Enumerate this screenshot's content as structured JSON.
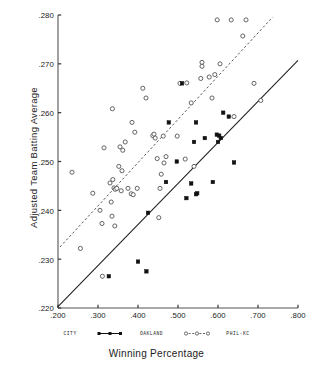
{
  "chart_data": {
    "type": "scatter",
    "title": "",
    "xlabel": "Winning Percentage",
    "ylabel": "Adjusted Team Batting Average",
    "xlim": [
      0.2,
      0.8
    ],
    "ylim": [
      0.22,
      0.28
    ],
    "xticks": [
      ".200",
      ".300",
      ".400",
      ".500",
      ".600",
      ".700",
      ".800"
    ],
    "xtick_values": [
      0.2,
      0.3,
      0.4,
      0.5,
      0.6,
      0.7,
      0.8
    ],
    "yticks": [
      ".280",
      ".270",
      ".260",
      ".250",
      ".240",
      ".230",
      ".220"
    ],
    "ytick_values": [
      0.28,
      0.27,
      0.26,
      0.25,
      0.24,
      0.23,
      0.22
    ],
    "grid": false,
    "legend_position": "below-axis",
    "legend_caption": "CITY",
    "series": [
      {
        "name": "OAKLAND",
        "marker": "filled-square",
        "color": "#111111",
        "trendline": "solid",
        "points": [
          [
            0.327,
            0.2265
          ],
          [
            0.4,
            0.2295
          ],
          [
            0.421,
            0.2275
          ],
          [
            0.425,
            0.2395
          ],
          [
            0.47,
            0.2458
          ],
          [
            0.477,
            0.258
          ],
          [
            0.497,
            0.25
          ],
          [
            0.51,
            0.266
          ],
          [
            0.521,
            0.2425
          ],
          [
            0.533,
            0.2455
          ],
          [
            0.545,
            0.2433
          ],
          [
            0.548,
            0.2435
          ],
          [
            0.54,
            0.254
          ],
          [
            0.545,
            0.258
          ],
          [
            0.567,
            0.2548
          ],
          [
            0.587,
            0.2458
          ],
          [
            0.597,
            0.2555
          ],
          [
            0.6,
            0.254
          ],
          [
            0.603,
            0.2553
          ],
          [
            0.607,
            0.2548
          ],
          [
            0.613,
            0.26
          ],
          [
            0.627,
            0.2592
          ],
          [
            0.64,
            0.2498
          ]
        ]
      },
      {
        "name": "PHIL-KC",
        "marker": "open-circle",
        "color": "#4a4a4a",
        "trendline": "dashed",
        "points": [
          [
            0.235,
            0.2478
          ],
          [
            0.256,
            0.2322
          ],
          [
            0.287,
            0.2435
          ],
          [
            0.305,
            0.24
          ],
          [
            0.31,
            0.2373
          ],
          [
            0.311,
            0.2265
          ],
          [
            0.315,
            0.2528
          ],
          [
            0.33,
            0.2456
          ],
          [
            0.333,
            0.2417
          ],
          [
            0.335,
            0.2388
          ],
          [
            0.336,
            0.2608
          ],
          [
            0.337,
            0.2463
          ],
          [
            0.34,
            0.2446
          ],
          [
            0.342,
            0.2368
          ],
          [
            0.343,
            0.2443
          ],
          [
            0.347,
            0.2445
          ],
          [
            0.352,
            0.249
          ],
          [
            0.355,
            0.253
          ],
          [
            0.358,
            0.244
          ],
          [
            0.36,
            0.2481
          ],
          [
            0.362,
            0.2523
          ],
          [
            0.368,
            0.254
          ],
          [
            0.375,
            0.2445
          ],
          [
            0.383,
            0.2434
          ],
          [
            0.385,
            0.258
          ],
          [
            0.388,
            0.2432
          ],
          [
            0.392,
            0.256
          ],
          [
            0.398,
            0.2445
          ],
          [
            0.412,
            0.265
          ],
          [
            0.42,
            0.263
          ],
          [
            0.437,
            0.2553
          ],
          [
            0.44,
            0.2556
          ],
          [
            0.443,
            0.2548
          ],
          [
            0.448,
            0.2506
          ],
          [
            0.452,
            0.2385
          ],
          [
            0.455,
            0.2445
          ],
          [
            0.458,
            0.2474
          ],
          [
            0.463,
            0.2552
          ],
          [
            0.465,
            0.2497
          ],
          [
            0.47,
            0.251
          ],
          [
            0.498,
            0.2552
          ],
          [
            0.505,
            0.266
          ],
          [
            0.518,
            0.2505
          ],
          [
            0.522,
            0.2661
          ],
          [
            0.533,
            0.262
          ],
          [
            0.54,
            0.249
          ],
          [
            0.557,
            0.267
          ],
          [
            0.56,
            0.2703
          ],
          [
            0.56,
            0.2695
          ],
          [
            0.578,
            0.2673
          ],
          [
            0.585,
            0.263
          ],
          [
            0.592,
            0.2678
          ],
          [
            0.598,
            0.279
          ],
          [
            0.605,
            0.27
          ],
          [
            0.633,
            0.279
          ],
          [
            0.64,
            0.2592
          ],
          [
            0.662,
            0.2757
          ],
          [
            0.67,
            0.279
          ],
          [
            0.69,
            0.266
          ],
          [
            0.707,
            0.2625
          ]
        ]
      }
    ],
    "trendlines": [
      {
        "series": "OAKLAND",
        "style": "solid",
        "x0": 0.2,
        "y0": 0.2203,
        "x1": 0.8,
        "y1": 0.2707
      },
      {
        "series": "PHIL-KC",
        "style": "dashed",
        "x0": 0.205,
        "y0": 0.2325,
        "x1": 0.737,
        "y1": 0.2796
      }
    ]
  },
  "legend": {
    "caption": "CITY",
    "entries": [
      {
        "label": "OAKLAND",
        "marker": "filled-square",
        "line": "solid"
      },
      {
        "label": "PHIL-KC",
        "marker": "open-circle",
        "line": "dashed"
      }
    ]
  },
  "axes": {
    "x_title": "Winning Percentage",
    "y_title": "Adjusted Team Batting Average"
  }
}
